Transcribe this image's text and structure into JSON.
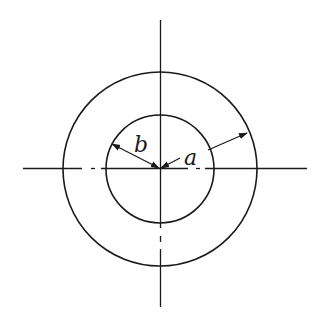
{
  "diagram": {
    "center": {
      "x": 160,
      "y": 169
    },
    "outer_circle": {
      "r": 97
    },
    "inner_circle": {
      "r": 54
    },
    "labels": {
      "inner_radius": "b",
      "outer_radius": "a"
    },
    "stroke_color": "#1a1a1a",
    "background": "#ffffff"
  }
}
